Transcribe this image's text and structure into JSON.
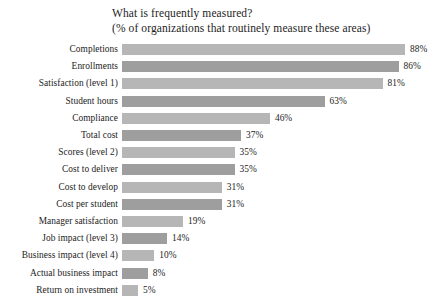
{
  "chart_data": {
    "type": "bar",
    "orientation": "horizontal",
    "title": "What is frequently measured?",
    "subtitle": "(% of organizations that routinely measure these areas)",
    "xlabel": "",
    "ylabel": "",
    "xlim": [
      0,
      88
    ],
    "grid": false,
    "legend": null,
    "value_suffix": "%",
    "categories": [
      "Completions",
      "Enrollments",
      "Satisfaction (level 1)",
      "Student hours",
      "Compliance",
      "Total cost",
      "Scores (level 2)",
      "Cost to deliver",
      "Cost to develop",
      "Cost per student",
      "Manager satisfaction",
      "Job impact (level 3)",
      "Business impact (level 4)",
      "Actual business impact",
      "Return on investment"
    ],
    "values": [
      88,
      86,
      81,
      63,
      46,
      37,
      35,
      35,
      31,
      31,
      19,
      14,
      10,
      8,
      5
    ],
    "value_labels": [
      "88%",
      "86%",
      "81%",
      "63%",
      "46%",
      "37%",
      "35%",
      "35%",
      "31%",
      "31%",
      "19%",
      "14%",
      "10%",
      "8%",
      "5%"
    ],
    "colors": {
      "bar_light": "#b6b6b6",
      "bar_dark": "#9e9e9e",
      "background": "#ffffff",
      "text": "#1d1d1d"
    }
  }
}
